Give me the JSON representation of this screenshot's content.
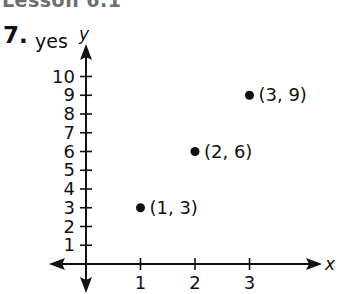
{
  "header": {
    "title": "Lesson 6.1"
  },
  "problem": {
    "number": "7.",
    "answer": "yes"
  },
  "chart_data": {
    "type": "scatter",
    "title": "",
    "xlabel": "x",
    "ylabel": "y",
    "x_ticks": [
      "1",
      "2",
      "3"
    ],
    "y_ticks": [
      "1",
      "2",
      "3",
      "4",
      "5",
      "6",
      "7",
      "8",
      "9",
      "10"
    ],
    "xlim": [
      -0.65,
      4.3
    ],
    "ylim": [
      -1.5,
      11.3
    ],
    "grid": false,
    "legend": null,
    "series": [
      {
        "name": "points",
        "points": [
          {
            "x": 1,
            "y": 3,
            "label": "(1, 3)"
          },
          {
            "x": 2,
            "y": 6,
            "label": "(2, 6)"
          },
          {
            "x": 3,
            "y": 9,
            "label": "(3, 9)"
          }
        ]
      }
    ],
    "annotations": [
      "(1, 3)",
      "(2, 6)",
      "(3, 9)"
    ],
    "colors": {
      "axis": "#111111",
      "points": "#111111"
    }
  }
}
